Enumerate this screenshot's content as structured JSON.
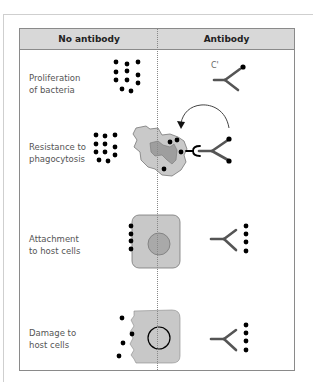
{
  "header": {
    "col_no_antibody": "No antibody",
    "col_antibody": "Antibody"
  },
  "rows": [
    {
      "label_line1": "Proliferation",
      "label_line2": "of bacteria",
      "antibody_annotation": "C'"
    },
    {
      "label_line1": "Resistance to",
      "label_line2": "phagocytosis"
    },
    {
      "label_line1": "Attachment",
      "label_line2": "to host cells"
    },
    {
      "label_line1": "Damage to",
      "label_line2": "host cells"
    }
  ],
  "colors": {
    "header_bg": "#d8d8d8",
    "cell_fill": "#c8c8c8",
    "nucleus_fill": "#a9a9a9",
    "antibody_stroke": "#555555",
    "bacteria": "#000000"
  }
}
